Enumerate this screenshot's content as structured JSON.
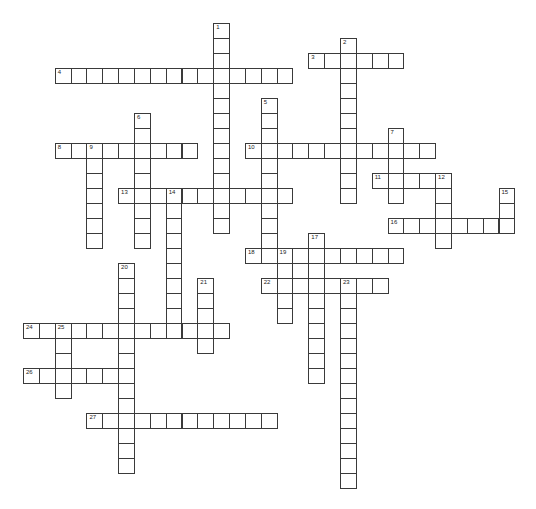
{
  "puzzle": {
    "type": "crossword",
    "title_visible": "",
    "entries": [
      {
        "number": 1,
        "direction": "down",
        "row": 0,
        "col": 12,
        "length": 14
      },
      {
        "number": 2,
        "direction": "down",
        "row": 1,
        "col": 20,
        "length": 11
      },
      {
        "number": 3,
        "direction": "across",
        "row": 2,
        "col": 18,
        "length": 6
      },
      {
        "number": 4,
        "direction": "across",
        "row": 3,
        "col": 2,
        "length": 15
      },
      {
        "number": 5,
        "direction": "down",
        "row": 5,
        "col": 15,
        "length": 11
      },
      {
        "number": 6,
        "direction": "down",
        "row": 6,
        "col": 7,
        "length": 9
      },
      {
        "number": 7,
        "direction": "down",
        "row": 7,
        "col": 23,
        "length": 5
      },
      {
        "number": 8,
        "direction": "across",
        "row": 8,
        "col": 2,
        "length": 9
      },
      {
        "number": 9,
        "direction": "down",
        "row": 8,
        "col": 4,
        "length": 7
      },
      {
        "number": 10,
        "direction": "across",
        "row": 8,
        "col": 14,
        "length": 12
      },
      {
        "number": 11,
        "direction": "across",
        "row": 10,
        "col": 22,
        "length": 4
      },
      {
        "number": 12,
        "direction": "down",
        "row": 10,
        "col": 26,
        "length": 5
      },
      {
        "number": 13,
        "direction": "across",
        "row": 11,
        "col": 6,
        "length": 11
      },
      {
        "number": 14,
        "direction": "down",
        "row": 11,
        "col": 9,
        "length": 10
      },
      {
        "number": 15,
        "direction": "down",
        "row": 11,
        "col": 30,
        "length": 3
      },
      {
        "number": 16,
        "direction": "across",
        "row": 13,
        "col": 23,
        "length": 8
      },
      {
        "number": 17,
        "direction": "down",
        "row": 14,
        "col": 18,
        "length": 10
      },
      {
        "number": 18,
        "direction": "across",
        "row": 15,
        "col": 14,
        "length": 10
      },
      {
        "number": 19,
        "direction": "down",
        "row": 15,
        "col": 16,
        "length": 5
      },
      {
        "number": 20,
        "direction": "down",
        "row": 16,
        "col": 6,
        "length": 14
      },
      {
        "number": 21,
        "direction": "down",
        "row": 17,
        "col": 11,
        "length": 5
      },
      {
        "number": 22,
        "direction": "across",
        "row": 17,
        "col": 15,
        "length": 8
      },
      {
        "number": 23,
        "direction": "down",
        "row": 17,
        "col": 20,
        "length": 14
      },
      {
        "number": 24,
        "direction": "across",
        "row": 20,
        "col": 0,
        "length": 13
      },
      {
        "number": 25,
        "direction": "down",
        "row": 20,
        "col": 2,
        "length": 5
      },
      {
        "number": 26,
        "direction": "across",
        "row": 23,
        "col": 0,
        "length": 7
      },
      {
        "number": 27,
        "direction": "across",
        "row": 26,
        "col": 4,
        "length": 12
      }
    ]
  }
}
